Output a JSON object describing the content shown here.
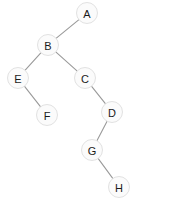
{
  "diagram": {
    "width": 175,
    "height": 206,
    "background_color": "#ffffff",
    "node_fill_color": "#fbfbfb",
    "node_stroke_color": "#e2e2e2",
    "node_label_color": "#1a1a1a",
    "edge_color": "#9a9a9a",
    "node_radius": 10.5,
    "nodes": [
      {
        "id": "A",
        "label": "A",
        "x": 87,
        "y": 13
      },
      {
        "id": "B",
        "label": "B",
        "x": 48,
        "y": 45
      },
      {
        "id": "E",
        "label": "E",
        "x": 18,
        "y": 78
      },
      {
        "id": "C",
        "label": "C",
        "x": 85,
        "y": 78
      },
      {
        "id": "F",
        "label": "F",
        "x": 47,
        "y": 115
      },
      {
        "id": "D",
        "label": "D",
        "x": 112,
        "y": 112
      },
      {
        "id": "G",
        "label": "G",
        "x": 92,
        "y": 150
      },
      {
        "id": "H",
        "label": "H",
        "x": 119,
        "y": 187
      }
    ],
    "edges": [
      {
        "from": "A",
        "to": "B"
      },
      {
        "from": "B",
        "to": "E"
      },
      {
        "from": "B",
        "to": "C"
      },
      {
        "from": "E",
        "to": "F"
      },
      {
        "from": "C",
        "to": "D"
      },
      {
        "from": "D",
        "to": "G"
      },
      {
        "from": "G",
        "to": "H"
      }
    ]
  }
}
